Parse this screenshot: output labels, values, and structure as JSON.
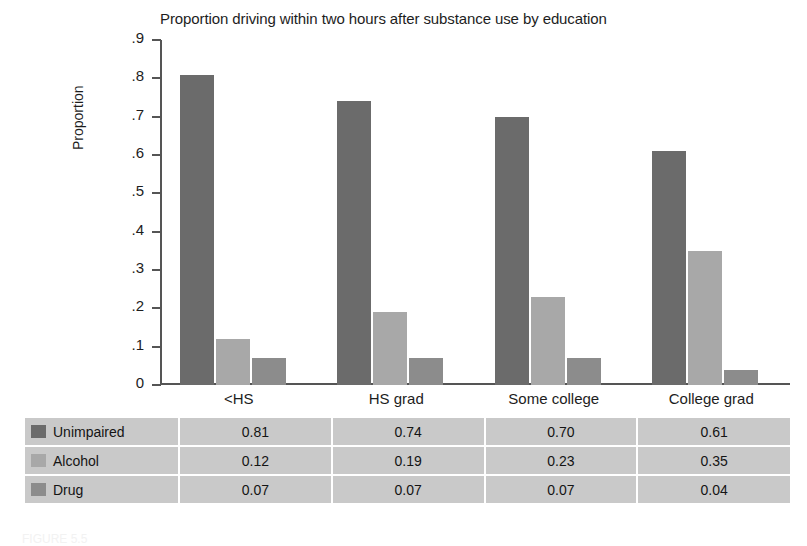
{
  "chart_data": {
    "type": "bar",
    "title": "Proportion driving within two hours after substance use by education",
    "xlabel": "",
    "ylabel": "Proportion",
    "categories": [
      "<HS",
      "HS grad",
      "Some college",
      "College grad"
    ],
    "series": [
      {
        "name": "Unimpaired",
        "values": [
          0.81,
          0.74,
          0.7,
          0.61
        ],
        "color": "#6b6b6b"
      },
      {
        "name": "Alcohol",
        "values": [
          0.12,
          0.19,
          0.23,
          0.35
        ],
        "color": "#a8a8a8"
      },
      {
        "name": "Drug",
        "values": [
          0.07,
          0.07,
          0.07,
          0.04
        ],
        "color": "#8c8c8c"
      }
    ],
    "ylim": [
      0,
      0.9
    ],
    "ytick_labels": [
      "0",
      ".1",
      ".2",
      ".3",
      ".4",
      ".5",
      ".6",
      ".7",
      ".8",
      ".9"
    ],
    "ytick_values": [
      0,
      0.1,
      0.2,
      0.3,
      0.4,
      0.5,
      0.6,
      0.7,
      0.8,
      0.9
    ],
    "grid": false,
    "legend_position": "table-row-labels"
  },
  "table": {
    "column_headers": [
      "",
      "<HS",
      "HS grad",
      "Some college",
      "College grad"
    ],
    "rows": [
      {
        "label": "Unimpaired",
        "color": "#6b6b6b",
        "values": [
          "0.81",
          "0.74",
          "0.70",
          "0.61"
        ]
      },
      {
        "label": "Alcohol",
        "color": "#a8a8a8",
        "values": [
          "0.12",
          "0.19",
          "0.23",
          "0.35"
        ]
      },
      {
        "label": "Drug",
        "color": "#8c8c8c",
        "values": [
          "0.07",
          "0.07",
          "0.07",
          "0.04"
        ]
      }
    ]
  },
  "caption": "FIGURE 5.5"
}
